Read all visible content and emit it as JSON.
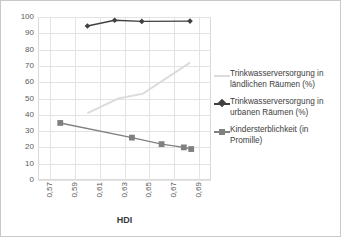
{
  "chart_data": {
    "type": "line",
    "title": "",
    "xlabel": "HDI",
    "ylabel": "",
    "xlim": [
      0.56,
      0.7
    ],
    "ylim": [
      0,
      100
    ],
    "grid": true,
    "legend_position": "right",
    "x_ticks": [
      "0,57",
      "0,59",
      "0,61",
      "0,63",
      "0,65",
      "0,67",
      "0,69"
    ],
    "x_tick_values": [
      0.57,
      0.59,
      0.61,
      0.63,
      0.65,
      0.67,
      0.69
    ],
    "y_ticks": [
      "0",
      "10",
      "20",
      "30",
      "40",
      "50",
      "60",
      "70",
      "80",
      "90",
      "100"
    ],
    "y_tick_values": [
      0,
      10,
      20,
      30,
      40,
      50,
      60,
      70,
      80,
      90,
      100
    ],
    "series": [
      {
        "name": "Trinkwasserversorgung in ländlichen Räumen (%)",
        "color": "#dcdcdc",
        "marker": "none",
        "x": [
          0.6,
          0.625,
          0.645,
          0.683
        ],
        "values": [
          41,
          50,
          53,
          72
        ]
      },
      {
        "name": "Trinkwasserversorgung in urbanen Räumen (%)",
        "color": "#404040",
        "marker": "diamond",
        "x": [
          0.6,
          0.622,
          0.644,
          0.683
        ],
        "values": [
          94.5,
          98,
          97.3,
          97.5
        ]
      },
      {
        "name": "Kindersterblichkeit (in Promille)",
        "color": "#808080",
        "marker": "square",
        "x": [
          0.578,
          0.636,
          0.66,
          0.678,
          0.684
        ],
        "values": [
          35,
          26,
          22,
          20,
          19
        ]
      }
    ]
  },
  "legend": {
    "entries": [
      {
        "label": "Trinkwasserversorgung in ländlichen Räumen (%)",
        "key": "line-swatch-light-grey"
      },
      {
        "label": "Trinkwasserversorgung in urbanen Räumen (%)",
        "key": "line-swatch-dark-diamond"
      },
      {
        "label": "Kindersterblichkeit (in Promille)",
        "key": "line-swatch-grey-square"
      }
    ]
  },
  "axes": {
    "x_title": "HDI"
  },
  "colors": {
    "rural_line": "#dcdcdc",
    "urban_line": "#404040",
    "mortality_line": "#808080",
    "gridline": "#e3e3e3",
    "frame": "#d9d9d9",
    "tick_text": "#5a5a5a",
    "legend_text": "#3d3d3d",
    "border": "#c8c8c8"
  }
}
